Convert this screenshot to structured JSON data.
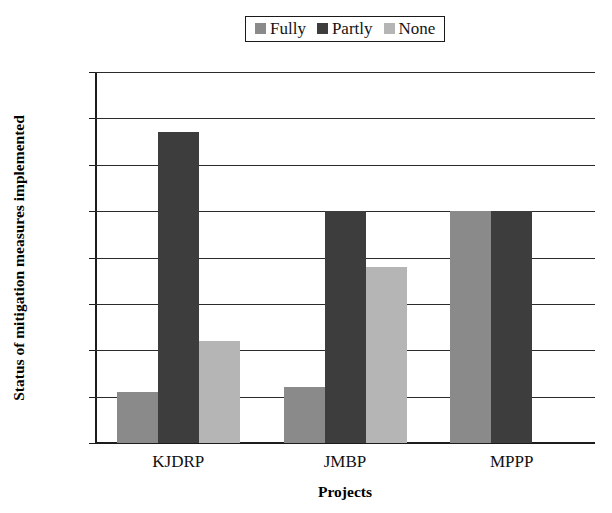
{
  "chart_data": {
    "type": "bar",
    "title": "",
    "xlabel": "Projects",
    "ylabel": "Status of mitigation measures implemented",
    "categories": [
      "KJDRP",
      "JMBP",
      "MPPP"
    ],
    "series": [
      {
        "name": "Fully",
        "values": [
          11,
          12,
          50
        ],
        "color": "#8a8a8a"
      },
      {
        "name": "Partly",
        "values": [
          67,
          50,
          50
        ],
        "color": "#3d3d3d"
      },
      {
        "name": "None",
        "values": [
          22,
          38,
          0
        ],
        "color": "#b5b5b5"
      }
    ],
    "ylim": [
      0,
      80
    ],
    "ytick_values": [
      0,
      10,
      20,
      30,
      40,
      50,
      60,
      70,
      80
    ],
    "ytick_labels": [
      "0%",
      "10%",
      "20%",
      "30%",
      "40%",
      "50%",
      "60%",
      "70%",
      "80%"
    ],
    "grid": true,
    "grid_axis": "y",
    "legend_position": "top-center",
    "legend_entries": [
      "Fully",
      "Partly",
      "None"
    ],
    "value_unit": "percent"
  },
  "axis_colors": {
    "axis_line": "#1c1c1c",
    "gridline": "#2b2b2b",
    "background": "#ffffff",
    "text": "#111111"
  }
}
